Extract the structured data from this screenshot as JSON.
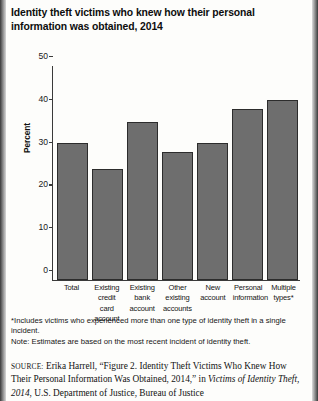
{
  "figure": {
    "title": "Identity theft victims who knew how their personal information was obtained, 2014"
  },
  "chart_data": {
    "type": "bar",
    "title": "Identity theft victims who knew how their personal information was obtained, 2014",
    "xlabel": "",
    "ylabel": "Percent",
    "ylim": [
      0,
      50
    ],
    "yticks": [
      0,
      10,
      20,
      30,
      40,
      50
    ],
    "grid": false,
    "legend": null,
    "bar_color": "#6e6e6e",
    "categories": [
      "Total",
      "Existing credit card account",
      "Existing bank account",
      "Other existing accounts",
      "New account",
      "Personal information",
      "Multiple types*"
    ],
    "category_lines": [
      [
        "Total"
      ],
      [
        "Existing",
        "credit card",
        "account"
      ],
      [
        "Existing",
        "bank",
        "account"
      ],
      [
        "Other",
        "existing",
        "accounts"
      ],
      [
        "New",
        "account"
      ],
      [
        "Personal",
        "information"
      ],
      [
        "Multiple",
        "types*"
      ]
    ],
    "values": [
      32,
      26,
      37,
      30,
      32,
      40,
      42
    ]
  },
  "notes": {
    "footnote_marker": "*",
    "footnote": "Includes victims who experienced more than one type of identity theft in a single incident.",
    "note": "Note: Estimates are based on the most recent incident of identity theft."
  },
  "source": {
    "label": "SOURCE:",
    "text_before_italic": " Erika Harrell, “Figure 2. Identity Theft Victims Who Knew How Their Personal Information Was Obtained, 2014,” in ",
    "italic_title": "Victims of Identity Theft, 2014",
    "text_after_italic": ", U.S. Department of Justice, Bureau of Justice"
  }
}
